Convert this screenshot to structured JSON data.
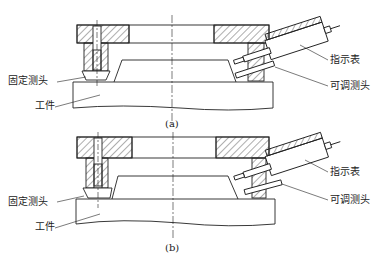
{
  "figures": [
    {
      "id": "a",
      "caption": "(a)",
      "labels": {
        "fixed_probe": "固定测头",
        "workpiece": "工件",
        "indicator": "指示表",
        "adjustable_probe": "可调测头"
      }
    },
    {
      "id": "b",
      "caption": "(b)",
      "labels": {
        "fixed_probe": "固定测头",
        "workpiece": "工件",
        "indicator": "指示表",
        "adjustable_probe": "可调测头"
      }
    }
  ],
  "colors": {
    "line": "#222222",
    "hatch": "#333333",
    "background": "#ffffff"
  }
}
